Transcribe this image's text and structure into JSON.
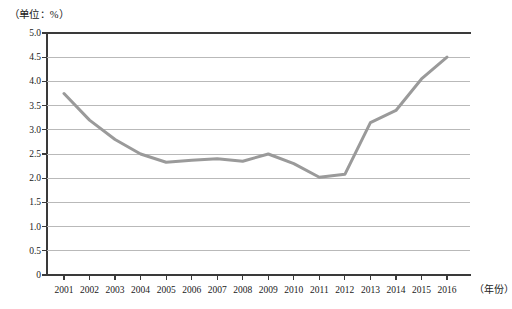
{
  "chart_data": {
    "type": "line",
    "title": "",
    "subtitle": "",
    "unit_caption": "（单位：%）",
    "xlabel": "（年份）",
    "ylabel": "",
    "categories": [
      "2001",
      "2002",
      "2003",
      "2004",
      "2005",
      "2006",
      "2007",
      "2008",
      "2009",
      "2010",
      "2011",
      "2012",
      "2013",
      "2014",
      "2015",
      "2016"
    ],
    "values": [
      3.75,
      3.2,
      2.8,
      2.5,
      2.33,
      2.37,
      2.4,
      2.35,
      2.5,
      2.3,
      2.02,
      2.08,
      3.15,
      3.4,
      4.05,
      4.5
    ],
    "series": [
      {
        "name": "",
        "values": [
          3.75,
          3.2,
          2.8,
          2.5,
          2.33,
          2.37,
          2.4,
          2.35,
          2.5,
          2.3,
          2.02,
          2.08,
          3.15,
          3.4,
          4.05,
          4.5
        ],
        "color": "#9a9a9a"
      }
    ],
    "ylim": [
      0,
      5.0
    ],
    "y_ticks": [
      0,
      0.5,
      1.0,
      1.5,
      2.0,
      2.5,
      3.0,
      3.5,
      4.0,
      4.5,
      5.0
    ],
    "y_tick_labels": [
      "0",
      "0.5",
      "1.0",
      "1.5",
      "2.0",
      "2.5",
      "3.0",
      "3.5",
      "4.0",
      "4.5",
      "5.0"
    ],
    "grid": "horizontal",
    "grid_color": "#b9b9b9",
    "legend": "none",
    "legend_position": "",
    "markers": false,
    "line_width_px": 3,
    "axis_color": "#3a3a3a",
    "background": "#ffffff"
  }
}
